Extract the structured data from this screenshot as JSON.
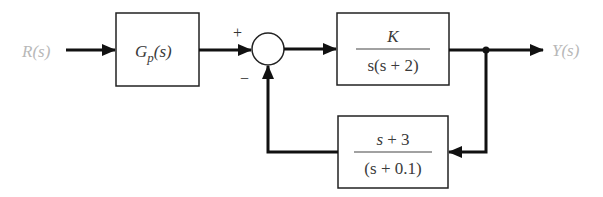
{
  "diagram": {
    "type": "feedback-control-block-diagram",
    "input_label": "R(s)",
    "output_label": "Y(s)",
    "prefilter": {
      "label_main": "G",
      "label_sub": "p",
      "label_tail": "(s)"
    },
    "summing_junction": {
      "plus_sign": "+",
      "minus_sign": "−"
    },
    "plant": {
      "numerator": "K",
      "denominator": "s(s + 2)"
    },
    "feedback": {
      "numerator": "s + 3",
      "denominator": "(s + 0.1)"
    },
    "colors": {
      "line": "#111111",
      "signal_label": "#b8b8b8",
      "block_text": "#3a3a3a"
    }
  }
}
